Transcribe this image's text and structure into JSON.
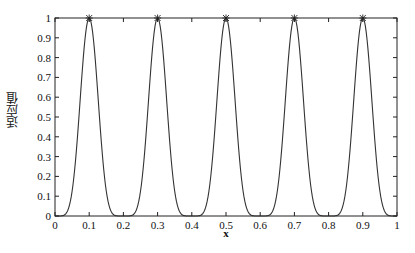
{
  "chart_data": {
    "type": "line",
    "title": "",
    "xlabel": "x",
    "ylabel": "适应值",
    "xlim": [
      0,
      1
    ],
    "ylim": [
      0,
      1
    ],
    "grid": false,
    "legend": null,
    "x_ticks": [
      "0",
      "0.1",
      "0.2",
      "0.3",
      "0.4",
      "0.5",
      "0.6",
      "0.7",
      "0.8",
      "0.9",
      "1"
    ],
    "y_ticks": [
      "0",
      "0.1",
      "0.2",
      "0.3",
      "0.4",
      "0.5",
      "0.6",
      "0.7",
      "0.8",
      "0.9",
      "1"
    ],
    "series": [
      {
        "name": "fitness curve",
        "function": "sin^6(5*pi*x)",
        "x": [
          0,
          0.025,
          0.05,
          0.075,
          0.1,
          0.125,
          0.15,
          0.175,
          0.2,
          0.225,
          0.25,
          0.275,
          0.3,
          0.325,
          0.35,
          0.375,
          0.4,
          0.425,
          0.45,
          0.475,
          0.5,
          0.525,
          0.55,
          0.575,
          0.6,
          0.625,
          0.65,
          0.675,
          0.7,
          0.725,
          0.75,
          0.775,
          0.8,
          0.825,
          0.85,
          0.875,
          0.9,
          0.925,
          0.95,
          0.975,
          1
        ],
        "values": [
          0,
          0.003,
          0.125,
          0.629,
          1,
          0.629,
          0.125,
          0.003,
          0,
          0.003,
          0.125,
          0.629,
          1,
          0.629,
          0.125,
          0.003,
          0,
          0.003,
          0.125,
          0.629,
          1,
          0.629,
          0.125,
          0.003,
          0,
          0.003,
          0.125,
          0.629,
          1,
          0.629,
          0.125,
          0.003,
          0,
          0.003,
          0.125,
          0.629,
          1,
          0.629,
          0.125,
          0.003,
          0
        ],
        "color": "#333333"
      },
      {
        "name": "peak markers",
        "marker": "*",
        "x": [
          0.1,
          0.3,
          0.5,
          0.7,
          0.9
        ],
        "values": [
          1,
          1,
          1,
          1,
          1
        ],
        "color": "#333333"
      }
    ]
  }
}
